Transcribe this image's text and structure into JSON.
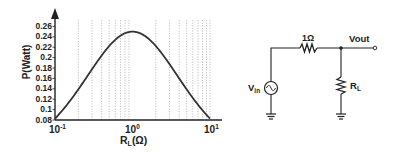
{
  "chart_data": {
    "type": "line",
    "title": "",
    "xlabel": "R_L(Ω)",
    "ylabel": "P(Watt)",
    "xscale": "log",
    "xlim": [
      0.1,
      10
    ],
    "ylim": [
      0.08,
      0.26
    ],
    "x_ticks": [
      "10^-1",
      "10^0",
      "10^1"
    ],
    "y_ticks": [
      "0.08",
      "0.1",
      "0.12",
      "0.14",
      "0.16",
      "0.18",
      "0.2",
      "0.22",
      "0.24",
      "0.26"
    ],
    "grid": "vertical dotted at minor log ticks",
    "series": [
      {
        "name": "P = RL/(1+RL)^2",
        "x": [
          0.1,
          0.15,
          0.2,
          0.3,
          0.4,
          0.5,
          0.6,
          0.7,
          0.8,
          0.9,
          1.0,
          1.2,
          1.5,
          2,
          3,
          4,
          5,
          6,
          7,
          8,
          9,
          10
        ],
        "values": [
          0.083,
          0.113,
          0.139,
          0.178,
          0.204,
          0.222,
          0.234,
          0.242,
          0.247,
          0.249,
          0.25,
          0.248,
          0.24,
          0.222,
          0.188,
          0.16,
          0.139,
          0.122,
          0.109,
          0.099,
          0.09,
          0.083
        ]
      }
    ]
  },
  "plot": {
    "y_axis_title": "P(Watt)",
    "x_axis_title_main": "R",
    "x_axis_title_sub": "L",
    "x_axis_title_unit": "(Ω)",
    "x_tick_base": "10",
    "x_tick_exps": [
      "-1",
      "0",
      "1"
    ],
    "y_tick_labels": [
      "0.26",
      "0.24",
      "0.22",
      "0.2",
      "0.18",
      "0.16",
      "0.14",
      "0.12",
      "0.1",
      "0.08"
    ]
  },
  "circuit": {
    "series_resistor_label": "1Ω",
    "output_label": "Vout",
    "source_label_main": "V",
    "source_label_sub": "in",
    "load_label_main": "R",
    "load_label_sub": "L"
  }
}
